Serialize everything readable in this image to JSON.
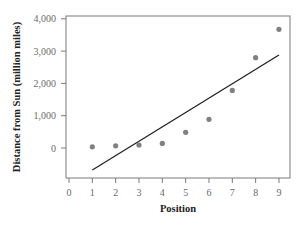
{
  "chart_data": {
    "type": "scatter",
    "title": "",
    "xlabel": "Position",
    "ylabel": "Distance from Sun (million miles)",
    "x": [
      1,
      2,
      3,
      4,
      5,
      6,
      7,
      8,
      9
    ],
    "series": [
      {
        "name": "Planets",
        "type": "scatter",
        "values": [
          36,
          67,
          93,
          142,
          484,
          887,
          1784,
          2795,
          3675
        ],
        "color": "#808080"
      },
      {
        "name": "Least-squares line",
        "type": "line",
        "x": [
          1,
          9
        ],
        "values": [
          -680,
          2880
        ],
        "color": "#222222"
      }
    ],
    "xlim": [
      0,
      9
    ],
    "ylim": [
      -1000,
      4000
    ],
    "xticks": [
      "0",
      "1",
      "2",
      "3",
      "4",
      "5",
      "6",
      "7",
      "8",
      "9"
    ],
    "yticks": [
      {
        "value": 0,
        "label": "0"
      },
      {
        "value": 1000,
        "label": "1,000"
      },
      {
        "value": 2000,
        "label": "2,000"
      },
      {
        "value": 3000,
        "label": "3,000"
      },
      {
        "value": 4000,
        "label": "4,000"
      }
    ],
    "grid": false,
    "legend": "none"
  }
}
